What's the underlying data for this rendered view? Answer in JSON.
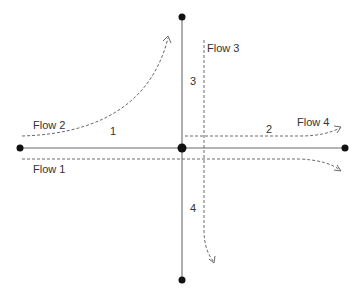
{
  "diagram": {
    "type": "intersection-flow-diagram",
    "flows": [
      {
        "id": "flow1",
        "label": "Flow 1"
      },
      {
        "id": "flow2",
        "label": "Flow 2"
      },
      {
        "id": "flow3",
        "label": "Flow 3"
      },
      {
        "id": "flow4",
        "label": "Flow 4"
      }
    ],
    "segments": [
      {
        "id": "seg1",
        "label": "1"
      },
      {
        "id": "seg2",
        "label": "2"
      },
      {
        "id": "seg3",
        "label": "3"
      },
      {
        "id": "seg4",
        "label": "4"
      }
    ],
    "nodes": [
      "left",
      "center",
      "right",
      "top",
      "bottom"
    ],
    "colors": {
      "road": "#9a9a9a",
      "flow": "#6a6a6a",
      "node": "#111111",
      "text": "#333333"
    }
  }
}
